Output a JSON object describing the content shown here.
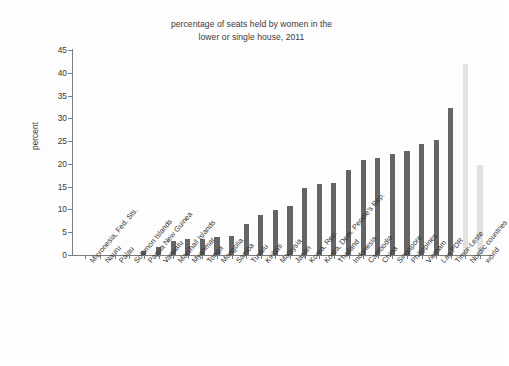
{
  "chart_data": {
    "type": "bar",
    "title": "percentage of seats held by women in the lower or single house, 2011",
    "title_line1": "percentage of seats held by women in the",
    "title_line2": "lower or single house, 2011",
    "xlabel": "",
    "ylabel": "percent",
    "ylim": [
      0,
      45
    ],
    "yticks": [
      0,
      5,
      10,
      15,
      20,
      25,
      30,
      35,
      40,
      45
    ],
    "grid": false,
    "legend": "none",
    "categories": [
      "Micronesia, Fed. Sts.",
      "Nauru",
      "Palau",
      "Solomon Islands",
      "Papua New Guinea",
      "Vanuatu",
      "Marshall Islands",
      "Myanmar",
      "Tonga",
      "Mongolia",
      "Samoa",
      "Tuvalu",
      "Kiribati",
      "Malaysia",
      "Japan",
      "Korea, Rep.",
      "Korea, Dem. People's Rep.",
      "Thailand",
      "Indonesia",
      "Cambodia",
      "China",
      "Singapore",
      "Philippines",
      "Vietnam",
      "Lao PDR",
      "Timor-Leste",
      "Nordic countries",
      "world"
    ],
    "values": [
      0.0,
      0.0,
      0.0,
      0.0,
      0.9,
      1.8,
      3.0,
      3.5,
      3.6,
      3.9,
      4.1,
      6.7,
      8.7,
      9.9,
      10.8,
      14.7,
      15.6,
      15.8,
      18.6,
      20.8,
      21.3,
      22.2,
      22.9,
      24.4,
      25.2,
      32.3,
      42.0,
      19.8
    ],
    "series": [
      {
        "name": "percentage of seats held by women",
        "values": [
          0.0,
          0.0,
          0.0,
          0.0,
          0.9,
          1.8,
          3.0,
          3.5,
          3.6,
          3.9,
          4.1,
          6.7,
          8.7,
          9.9,
          10.8,
          14.7,
          15.6,
          15.8,
          18.6,
          20.8,
          21.3,
          22.2,
          22.9,
          24.4,
          25.2,
          32.3,
          42.0,
          19.8
        ]
      }
    ],
    "bar_styles": [
      "dark",
      "dark",
      "dark",
      "dark",
      "dark",
      "dark",
      "dark",
      "dark",
      "dark",
      "dark",
      "dark",
      "dark",
      "dark",
      "dark",
      "dark",
      "dark",
      "dark",
      "dark",
      "dark",
      "dark",
      "dark",
      "dark",
      "dark",
      "dark",
      "dark",
      "dark",
      "light",
      "light"
    ],
    "colors": {
      "bar_dark": "#656565",
      "bar_light": "#e2e2e2",
      "axis": "#7d7d7d",
      "text": "#2e2e2e",
      "background": "#fdfdfd"
    }
  }
}
